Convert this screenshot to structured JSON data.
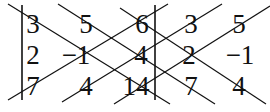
{
  "matrix": [
    [
      "3",
      "5",
      "6"
    ],
    [
      "2",
      "−1",
      "4"
    ],
    [
      "7",
      "4",
      "14"
    ]
  ],
  "repeated_columns": [
    [
      "3",
      "5"
    ],
    [
      "2",
      "−1"
    ],
    [
      "7",
      "4"
    ]
  ],
  "cells": {
    "r0c0": "3",
    "r0c1": "5",
    "r0c2": "6",
    "r0c3": "3",
    "r0c4": "5",
    "r1c0": "2",
    "r1c1": "−1",
    "r1c2": "4",
    "r1c3": "2",
    "r1c4": "−1",
    "r2c0": "7",
    "r2c1": "4",
    "r2c2": "14",
    "r2c3": "7",
    "r2c4": "4"
  },
  "colors": {
    "ink": "#111111",
    "background": "#ffffff"
  }
}
